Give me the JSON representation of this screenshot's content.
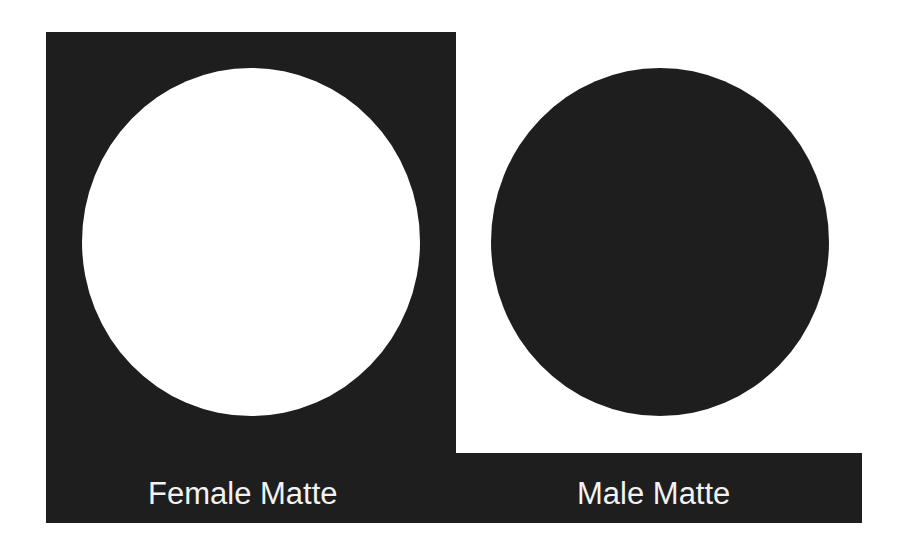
{
  "colors": {
    "dark": "#1e1e1e",
    "background": "#ffffff",
    "label_text": "#f2f2f2"
  },
  "female": {
    "label": "Female Matte",
    "description": "Dark panel with a white circular cut-out"
  },
  "male": {
    "label": "Male Matte",
    "description": "Solid dark circle on white"
  }
}
